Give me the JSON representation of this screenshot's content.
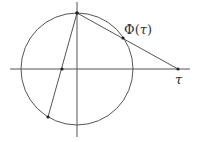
{
  "diagram": {
    "colors": {
      "stroke": "#555555",
      "point": "#222222",
      "background": "#ffffff",
      "text": "#333333"
    },
    "axes": {
      "horizontal": {
        "x1": 10,
        "y1": 69,
        "x2": 190,
        "y2": 69
      },
      "vertical": {
        "x1": 77,
        "y1": 2,
        "x2": 77,
        "y2": 137
      }
    },
    "circle": {
      "cx": 77,
      "cy": 69,
      "r": 56
    },
    "points": {
      "north_pole": {
        "x": 77,
        "y": 13
      },
      "phi_tau": {
        "x": 123,
        "y": 38
      },
      "tau": {
        "x": 178,
        "y": 69
      },
      "axis_point": {
        "x": 62,
        "y": 69
      },
      "lower_circle_point": {
        "x": 48,
        "y": 117
      }
    },
    "lines": [
      {
        "name": "north-to-tau",
        "from": "north_pole",
        "to": "tau"
      },
      {
        "name": "north-to-lower",
        "from": "north_pole",
        "to": "lower_circle_point"
      }
    ],
    "labels": {
      "phi_prefix": "Φ(",
      "phi_var": "τ",
      "phi_suffix": ")",
      "tau": "τ"
    }
  }
}
